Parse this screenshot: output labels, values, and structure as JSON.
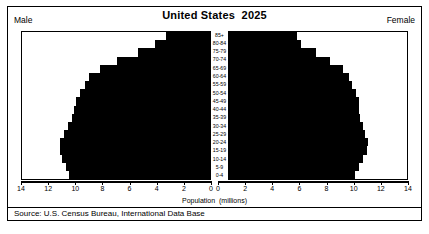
{
  "header": {
    "title": "United States  2025",
    "male_label": "Male",
    "female_label": "Female"
  },
  "axis": {
    "xlabel": "Population  (millions)",
    "ticks": [
      14,
      12,
      10,
      8,
      6,
      4,
      2,
      0
    ],
    "ticks_right": [
      0,
      2,
      4,
      6,
      8,
      10,
      12,
      14
    ],
    "max": 14
  },
  "source": "Source: U.S. Census Bureau, International Data Base",
  "chart_data": {
    "type": "bar",
    "subtype": "population-pyramid",
    "title": "United States  2025",
    "xlabel": "Population  (millions)",
    "ylabel": "",
    "xlim": [
      0,
      14
    ],
    "grid": false,
    "legend": [
      "Male",
      "Female"
    ],
    "legend_position": "top-corners",
    "orientation": "horizontal",
    "categories": [
      "85+",
      "80-84",
      "75-79",
      "70-74",
      "65-69",
      "60-64",
      "55-59",
      "50-54",
      "45-49",
      "40-44",
      "35-39",
      "30-34",
      "25-29",
      "20-24",
      "15-19",
      "10-14",
      "5-9",
      "0-4"
    ],
    "series": [
      {
        "name": "Male",
        "side": "left",
        "values": [
          3.3,
          4.1,
          5.4,
          6.9,
          8.2,
          9.0,
          9.3,
          9.7,
          10.0,
          10.1,
          10.3,
          10.6,
          10.9,
          11.2,
          11.2,
          11.0,
          10.7,
          10.5
        ]
      },
      {
        "name": "Female",
        "side": "right",
        "values": [
          5.8,
          6.1,
          7.2,
          8.3,
          9.2,
          9.7,
          9.9,
          10.2,
          10.4,
          10.4,
          10.5,
          10.7,
          10.9,
          11.1,
          11.0,
          10.7,
          10.4,
          10.1
        ]
      }
    ]
  }
}
